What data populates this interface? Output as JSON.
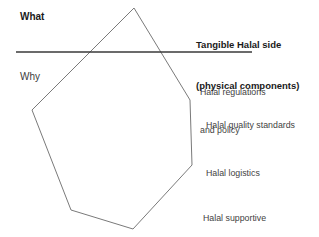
{
  "diagram": {
    "left_labels": {
      "what": "What",
      "why": "Why"
    },
    "right_heading": {
      "line1": "Tangible Halal side",
      "line2": "(physical components)"
    },
    "right_items": [
      {
        "line1": "Halal regulations",
        "line2": "and policy"
      },
      {
        "line1": "Halal quality standards",
        "line2": ""
      },
      {
        "line1": "Halal logistics",
        "line2": ""
      },
      {
        "line1": "Halal supportive",
        "line2": "services (finance, etc.)"
      }
    ],
    "colors": {
      "background": "#ffffff",
      "polygon_stroke": "#7a7a7a",
      "divider_stroke": "#3a3a3a",
      "heading_text": "#1a1a1a",
      "body_text": "#3f3f3f"
    },
    "shapes": {
      "polygon_points": "134,8 190,100 192,165 133,229 71,210 32,110 134,8",
      "divider": {
        "x1": 16,
        "y1": 52,
        "x2": 252,
        "y2": 52
      }
    }
  }
}
